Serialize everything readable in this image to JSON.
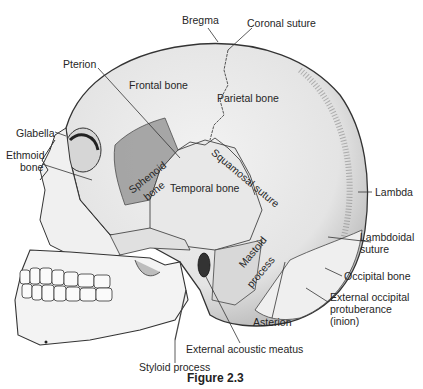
{
  "figure": {
    "caption": "Figure 2.3"
  },
  "labels": {
    "bregma": "Bregma",
    "coronal_suture": "Coronal suture",
    "pterion": "Pterion",
    "frontal_bone": "Frontal bone",
    "parietal_bone": "Parietal bone",
    "glabella": "Glabella",
    "ethmoid_bone_1": "Ethmoid",
    "ethmoid_bone_2": "bone",
    "sphenoid_bone_1": "Sphenoid",
    "sphenoid_bone_2": "bone",
    "squamosal_suture": "Squamosal suture",
    "temporal_bone": "Temporal bone",
    "lambda": "Lambda",
    "lambdoidal_suture_1": "Lambdoidal",
    "lambdoidal_suture_2": "suture",
    "mastoid_process_1": "Mastoid",
    "mastoid_process_2": "process",
    "occipital_bone": "Occipital bone",
    "ext_occ_1": "External occipital",
    "ext_occ_2": "protuberance",
    "ext_occ_3": "(inion)",
    "asterion": "Asterion",
    "external_acoustic_meatus": "External acoustic meatus",
    "styloid_process": "Styloid process"
  }
}
